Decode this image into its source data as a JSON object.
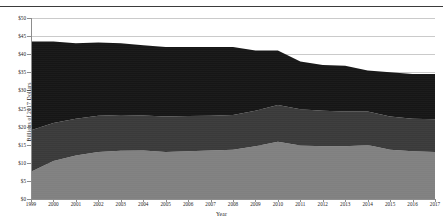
{
  "figure": {
    "truncated_title_above": "",
    "x_axis_title": "Year",
    "y_axis_title": "Billions of 2017 Dollars"
  },
  "colors": {
    "series_bottom": "#808080",
    "series_middle": "#3a3a3a",
    "series_top": "#161616",
    "gridline": "#c9c9c9",
    "axis": "#8d8d8d",
    "text": "#1c1c1c",
    "background": "#ffffff"
  },
  "chart_data": {
    "type": "area",
    "stacked": true,
    "title": "",
    "xlabel": "Year",
    "ylabel": "Billions of 2017 Dollars",
    "xlim": [
      1999,
      2017
    ],
    "ylim": [
      0,
      50
    ],
    "ytick_step": 5,
    "grid": true,
    "legend_position": "none",
    "ytick_labels": [
      "$0",
      "$5",
      "$10",
      "$15",
      "$20",
      "$25",
      "$30",
      "$35",
      "$40",
      "$45",
      "$50"
    ],
    "ytick_values": [
      0,
      5,
      10,
      15,
      20,
      25,
      30,
      35,
      40,
      45,
      50
    ],
    "categories": [
      1999,
      2000,
      2001,
      2002,
      2003,
      2004,
      2005,
      2006,
      2007,
      2008,
      2009,
      2010,
      2011,
      2012,
      2013,
      2014,
      2015,
      2016,
      2017
    ],
    "xtick_labels": [
      "1999",
      "2000",
      "2001",
      "2002",
      "2003",
      "2004",
      "2005",
      "2006",
      "2007",
      "2008",
      "2009",
      "2010",
      "2011",
      "2012",
      "2013",
      "2014",
      "2015",
      "2016",
      "2017"
    ],
    "series": [
      {
        "name": "bottom-band",
        "color": "#808080",
        "values": [
          7.5,
          10.5,
          12.0,
          13.0,
          13.3,
          13.4,
          13.0,
          13.2,
          13.4,
          13.6,
          14.6,
          15.8,
          14.8,
          14.6,
          14.6,
          14.9,
          13.6,
          13.2,
          13.0
        ]
      },
      {
        "name": "middle-band",
        "color": "#3a3a3a",
        "values": [
          11.5,
          10.5,
          10.2,
          10.0,
          9.9,
          9.7,
          9.8,
          9.7,
          9.6,
          9.6,
          9.8,
          10.2,
          10.0,
          9.8,
          9.6,
          9.3,
          9.2,
          9.0,
          9.0
        ]
      },
      {
        "name": "top-band",
        "color": "#161616",
        "values": [
          24.5,
          22.5,
          20.8,
          20.2,
          19.8,
          19.4,
          19.2,
          19.1,
          19.0,
          18.8,
          16.6,
          15.0,
          13.2,
          12.6,
          12.6,
          11.3,
          12.2,
          12.3,
          12.5
        ]
      }
    ],
    "totals": [
      43.5,
      43.5,
      43.0,
      43.2,
      43.0,
      42.5,
      42.0,
      42.0,
      42.0,
      42.0,
      41.0,
      41.0,
      38.0,
      37.0,
      36.8,
      35.5,
      35.0,
      34.5,
      34.5
    ]
  }
}
